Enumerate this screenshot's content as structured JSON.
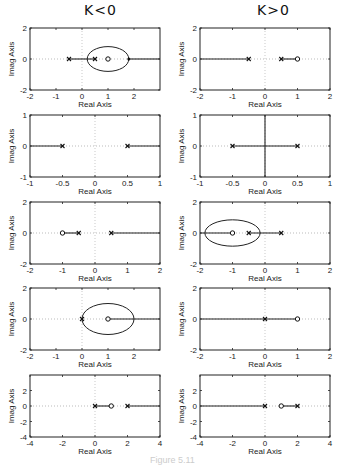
{
  "headings": {
    "left": "K<0",
    "right": "K>0"
  },
  "caption": "Figure 5.11",
  "axis_labels": {
    "x": "Real Axis",
    "y": "Imag Axis"
  },
  "chart_data": [
    {
      "type": "scatter",
      "id": "L1",
      "title": "K<0 row1",
      "xlabel": "Real Axis",
      "ylabel": "Imag Axis",
      "xlim": [
        -2,
        3
      ],
      "ylim": [
        -2,
        2
      ],
      "xticks": [
        -2,
        -1,
        0,
        1,
        2
      ],
      "yticks": [
        -2,
        0,
        2
      ],
      "poles": [
        -0.5,
        0.5
      ],
      "zeros": [
        1
      ],
      "locus_segments": [
        [
          -0.5,
          0.5
        ],
        [
          1.8,
          3
        ]
      ],
      "circle": {
        "cx": 1,
        "r": 0.8
      },
      "breakpoints": [
        1.8
      ]
    },
    {
      "type": "scatter",
      "id": "R1",
      "title": "K>0 row1",
      "xlabel": "Real Axis",
      "ylabel": "Imag Axis",
      "xlim": [
        -2,
        2
      ],
      "ylim": [
        -2,
        2
      ],
      "xticks": [
        -2,
        -1,
        0,
        1,
        2
      ],
      "yticks": [
        -2,
        0,
        2
      ],
      "poles": [
        -0.5,
        0.5
      ],
      "zeros": [
        1
      ],
      "locus_segments": [
        [
          -2,
          -0.5
        ],
        [
          0.5,
          1
        ]
      ]
    },
    {
      "type": "scatter",
      "id": "L2",
      "title": "K<0 row2",
      "xlabel": "Real Axis",
      "ylabel": "Imag Axis",
      "xlim": [
        -1,
        1
      ],
      "ylim": [
        -1,
        1
      ],
      "xticks": [
        -1,
        -0.5,
        0,
        0.5,
        1
      ],
      "yticks": [
        -1,
        0,
        1
      ],
      "poles": [
        -0.5,
        0.5
      ],
      "zeros": [],
      "locus_segments": [
        [
          -1,
          -0.5
        ],
        [
          0.5,
          1
        ]
      ]
    },
    {
      "type": "scatter",
      "id": "R2",
      "title": "K>0 row2",
      "xlabel": "Real Axis",
      "ylabel": "Imag Axis",
      "xlim": [
        -1,
        1
      ],
      "ylim": [
        -1,
        1
      ],
      "xticks": [
        -1,
        -0.5,
        0,
        0.5,
        1
      ],
      "yticks": [
        -1,
        0,
        1
      ],
      "poles": [
        -0.5,
        0.5
      ],
      "zeros": [],
      "locus_segments": [
        [
          -0.5,
          0.5
        ]
      ],
      "vertical_line": 0
    },
    {
      "type": "scatter",
      "id": "L3",
      "title": "K<0 row3",
      "xlabel": "Real Axis",
      "ylabel": "Imag Axis",
      "xlim": [
        -2,
        2
      ],
      "ylim": [
        -2,
        2
      ],
      "xticks": [
        -2,
        -1,
        0,
        1,
        2
      ],
      "yticks": [
        -2,
        0,
        2
      ],
      "poles": [
        -0.5,
        0.5
      ],
      "zeros": [
        -1
      ],
      "locus_segments": [
        [
          -1,
          -0.5
        ],
        [
          0.5,
          2
        ]
      ]
    },
    {
      "type": "scatter",
      "id": "R3",
      "title": "K>0 row3",
      "xlabel": "Real Axis",
      "ylabel": "Imag Axis",
      "xlim": [
        -2,
        2
      ],
      "ylim": [
        -2,
        2
      ],
      "xticks": [
        -2,
        -1,
        0,
        1,
        2
      ],
      "yticks": [
        -2,
        0,
        2
      ],
      "poles": [
        -0.5,
        0.5
      ],
      "zeros": [
        -1
      ],
      "locus_segments": [
        [
          -2,
          -1
        ],
        [
          -0.5,
          0.5
        ]
      ],
      "circle": {
        "cx": -1,
        "r": 0.85
      }
    },
    {
      "type": "scatter",
      "id": "L4",
      "title": "K<0 row4",
      "xlabel": "Real Axis",
      "ylabel": "Imag Axis",
      "xlim": [
        -2,
        3
      ],
      "ylim": [
        -2,
        2
      ],
      "xticks": [
        -2,
        -1,
        0,
        1,
        2
      ],
      "yticks": [
        -2,
        0,
        2
      ],
      "poles": [
        0
      ],
      "zeros": [
        1
      ],
      "locus_segments": [
        [
          1,
          3
        ]
      ],
      "circle": {
        "cx": 1,
        "r": 1
      }
    },
    {
      "type": "scatter",
      "id": "R4",
      "title": "K>0 row4",
      "xlabel": "Real Axis",
      "ylabel": "Imag Axis",
      "xlim": [
        -2,
        2
      ],
      "ylim": [
        -2,
        2
      ],
      "xticks": [
        -2,
        -1,
        0,
        1,
        2
      ],
      "yticks": [
        -2,
        0,
        2
      ],
      "poles": [
        0
      ],
      "zeros": [
        1
      ],
      "locus_segments": [
        [
          -2,
          1
        ]
      ]
    },
    {
      "type": "scatter",
      "id": "L5",
      "title": "K<0 row5",
      "xlabel": "Real Axis",
      "ylabel": "Imag Axis",
      "xlim": [
        -4,
        4
      ],
      "ylim": [
        -4,
        4
      ],
      "xticks": [
        -4,
        -2,
        0,
        2,
        4
      ],
      "yticks": [
        -4,
        -2,
        0,
        2
      ],
      "poles": [
        0,
        2
      ],
      "zeros": [
        1
      ],
      "locus_segments": [
        [
          0,
          1
        ],
        [
          2,
          4
        ]
      ]
    },
    {
      "type": "scatter",
      "id": "R5",
      "title": "K>0 row5",
      "xlabel": "Real Axis",
      "ylabel": "Imag Axis",
      "xlim": [
        -4,
        4
      ],
      "ylim": [
        -4,
        4
      ],
      "xticks": [
        -4,
        -2,
        0,
        2,
        4
      ],
      "yticks": [
        -4,
        -2,
        0,
        2
      ],
      "poles": [
        0,
        2
      ],
      "zeros": [
        1
      ],
      "locus_segments": [
        [
          -4,
          0
        ],
        [
          1,
          2
        ]
      ]
    }
  ],
  "layout": [
    {
      "id": "L1",
      "x": 30,
      "y": 28,
      "w": 130,
      "h": 62
    },
    {
      "id": "R1",
      "x": 200,
      "y": 28,
      "w": 130,
      "h": 62
    },
    {
      "id": "L2",
      "x": 30,
      "y": 115,
      "w": 130,
      "h": 62
    },
    {
      "id": "R2",
      "x": 200,
      "y": 115,
      "w": 130,
      "h": 62
    },
    {
      "id": "L3",
      "x": 30,
      "y": 202,
      "w": 130,
      "h": 62
    },
    {
      "id": "R3",
      "x": 200,
      "y": 202,
      "w": 130,
      "h": 62
    },
    {
      "id": "L4",
      "x": 30,
      "y": 288,
      "w": 130,
      "h": 62
    },
    {
      "id": "R4",
      "x": 200,
      "y": 288,
      "w": 130,
      "h": 62
    },
    {
      "id": "L5",
      "x": 30,
      "y": 375,
      "w": 130,
      "h": 62
    },
    {
      "id": "R5",
      "x": 200,
      "y": 375,
      "w": 130,
      "h": 62
    }
  ]
}
